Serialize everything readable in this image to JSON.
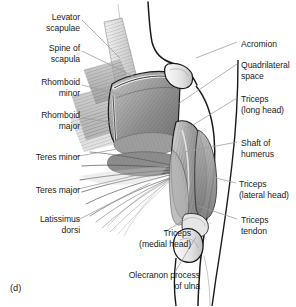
{
  "figure": {
    "caption": "(d)",
    "background_color": "#ffffff",
    "text_color": "#1b1b1b",
    "leader_line_color": "#9a9a9a",
    "outline_color": "#1a1a1a"
  },
  "labels": {
    "left": [
      {
        "id": "levator-scapulae",
        "text": "Levator\nscapulae",
        "x": 8,
        "y": 12,
        "w": 72
      },
      {
        "id": "spine-of-scapula",
        "text": "Spine of\nscapula",
        "x": 8,
        "y": 43,
        "w": 72
      },
      {
        "id": "rhomboid-minor",
        "text": "Rhomboid\nminor",
        "x": 2,
        "y": 77,
        "w": 78
      },
      {
        "id": "rhomboid-major",
        "text": "Rhomboid\nmajor",
        "x": 2,
        "y": 110,
        "w": 78
      },
      {
        "id": "teres-minor",
        "text": "Teres minor",
        "x": 2,
        "y": 152,
        "w": 78
      },
      {
        "id": "teres-major",
        "text": "Teres major",
        "x": 2,
        "y": 185,
        "w": 78
      },
      {
        "id": "latissimus-dorsi",
        "text": "Latissimus\ndorsi",
        "x": 2,
        "y": 214,
        "w": 78
      }
    ],
    "right": [
      {
        "id": "acromion",
        "text": "Acromion",
        "x": 241,
        "y": 39,
        "w": 56
      },
      {
        "id": "quadrilateral-space",
        "text": "Quadrilateral\nspace",
        "x": 241,
        "y": 60,
        "w": 56
      },
      {
        "id": "triceps-long-head",
        "text": "Triceps\n(long head)",
        "x": 241,
        "y": 94,
        "w": 56
      },
      {
        "id": "shaft-of-humerus",
        "text": "Shaft of\nhumerus",
        "x": 241,
        "y": 138,
        "w": 56
      },
      {
        "id": "triceps-lateral-head",
        "text": "Triceps\n(lateral head)",
        "x": 239,
        "y": 179,
        "w": 58
      },
      {
        "id": "triceps-tendon",
        "text": "Triceps\ntendon",
        "x": 241,
        "y": 215,
        "w": 56
      }
    ],
    "bottom": [
      {
        "id": "triceps-medial-head",
        "text": "Triceps\n(medial head)",
        "x": 115,
        "y": 228,
        "w": 76
      },
      {
        "id": "olecranon-process-ulna",
        "text": "Olecranon process\nof ulna",
        "x": 88,
        "y": 270,
        "w": 112
      }
    ]
  },
  "leader_lines": [
    {
      "id": "leader-levator-scapulae",
      "x1": 82,
      "y1": 20,
      "x2": 120,
      "y2": 58
    },
    {
      "id": "leader-spine-of-scapula",
      "x1": 82,
      "y1": 51,
      "x2": 137,
      "y2": 78
    },
    {
      "id": "leader-rhomboid-minor",
      "x1": 82,
      "y1": 85,
      "x2": 126,
      "y2": 96
    },
    {
      "id": "leader-rhomboid-major",
      "x1": 82,
      "y1": 118,
      "x2": 130,
      "y2": 125
    },
    {
      "id": "leader-teres-minor",
      "x1": 74,
      "y1": 157,
      "x2": 133,
      "y2": 146
    },
    {
      "id": "leader-teres-major",
      "x1": 74,
      "y1": 190,
      "x2": 137,
      "y2": 175
    },
    {
      "id": "leader-latissimus-dorsi",
      "x1": 74,
      "y1": 222,
      "x2": 150,
      "y2": 183
    },
    {
      "id": "leader-acromion",
      "x1": 237,
      "y1": 42,
      "x2": 196,
      "y2": 58
    },
    {
      "id": "leader-quadrilateral-space",
      "x1": 237,
      "y1": 64,
      "x2": 178,
      "y2": 104
    },
    {
      "id": "leader-triceps-long-head",
      "x1": 237,
      "y1": 98,
      "x2": 188,
      "y2": 128
    },
    {
      "id": "leader-shaft-of-humerus",
      "x1": 237,
      "y1": 142,
      "x2": 185,
      "y2": 152
    },
    {
      "id": "leader-triceps-lateral",
      "x1": 236,
      "y1": 183,
      "x2": 196,
      "y2": 173
    },
    {
      "id": "leader-triceps-tendon",
      "x1": 237,
      "y1": 219,
      "x2": 198,
      "y2": 206
    },
    {
      "id": "leader-triceps-medial",
      "x1": 164,
      "y1": 232,
      "x2": 188,
      "y2": 218
    },
    {
      "id": "leader-olecranon",
      "x1": 175,
      "y1": 272,
      "x2": 196,
      "y2": 237
    }
  ]
}
